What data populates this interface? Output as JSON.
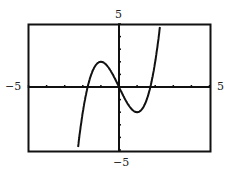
{
  "chart_data": {
    "type": "line",
    "title": "",
    "xlabel": "",
    "ylabel": "",
    "xlim": [
      -5,
      5
    ],
    "ylim": [
      -5,
      5
    ],
    "grid": false,
    "function": "y = x^3 - 3x",
    "tick_labels": {
      "x_min": "−5",
      "x_max": "5",
      "y_min": "−5",
      "y_max": "5"
    },
    "x_ticks": [
      -5,
      -4,
      -3,
      -2,
      -1,
      0,
      1,
      2,
      3,
      4,
      5
    ],
    "y_ticks": [
      -5,
      -4,
      -3,
      -2,
      -1,
      0,
      1,
      2,
      3,
      4,
      5
    ],
    "series": [
      {
        "name": "f(x)",
        "x": [
          -2.2,
          -2,
          -1.73,
          -1.5,
          -1,
          -0.5,
          0,
          0.5,
          1,
          1.5,
          1.73,
          2,
          2.2
        ],
        "values": [
          -4.05,
          -2,
          0,
          1.13,
          2,
          1.38,
          0,
          -1.38,
          -2,
          -1.13,
          0,
          2,
          4.05
        ]
      }
    ],
    "colors": {
      "curve": "#111111",
      "frame": "#111111"
    }
  }
}
